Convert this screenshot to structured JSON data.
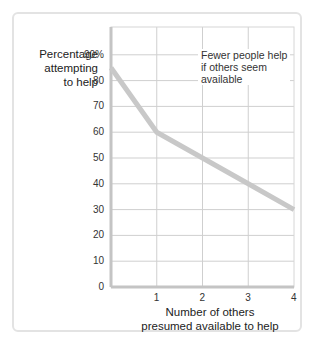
{
  "chart_data": {
    "type": "line",
    "title": "",
    "xlabel": "Number of others presumed available to help",
    "ylabel": "Percentage attempting to help",
    "x": [
      0,
      1,
      2,
      3,
      4
    ],
    "series": [
      {
        "name": "Percentage attempting to help",
        "values": [
          85,
          60,
          50,
          40,
          30
        ]
      }
    ],
    "xticks": [
      "1",
      "2",
      "3",
      "4"
    ],
    "yticks": [
      "0",
      "10",
      "20",
      "30",
      "40",
      "50",
      "60",
      "70",
      "80",
      "90%"
    ],
    "xlim": [
      0,
      4
    ],
    "ylim": [
      0,
      95
    ],
    "grid": true,
    "annotations": [
      "Fewer people help if others seem available"
    ],
    "line_color": "#c8c8c8"
  },
  "labels": {
    "ylabel_line1": "Percentage",
    "ylabel_line2": "attempting",
    "ylabel_line3": "to help",
    "xlabel_line1": "Number of others",
    "xlabel_line2": "presumed available to help",
    "annot_line1": "Fewer people help",
    "annot_line2": "if others seem",
    "annot_line3": "available"
  }
}
